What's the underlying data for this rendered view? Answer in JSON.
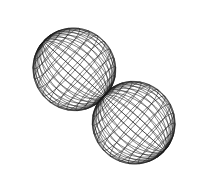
{
  "figure": {
    "type": "3d-wireframe-surface",
    "colors": {
      "background": "#ffffff",
      "mesh": "#1a1a1a"
    },
    "surface": {
      "shape": "r = |cos(theta)|^0.6 lobes (p-orbital-like)",
      "center": [
        104,
        96
      ],
      "axis_angle_deg": 42,
      "scale": 92,
      "lobe_width": 0.62,
      "tilt_deg": 28,
      "theta_lines": 26,
      "phi_lines": 36
    }
  }
}
